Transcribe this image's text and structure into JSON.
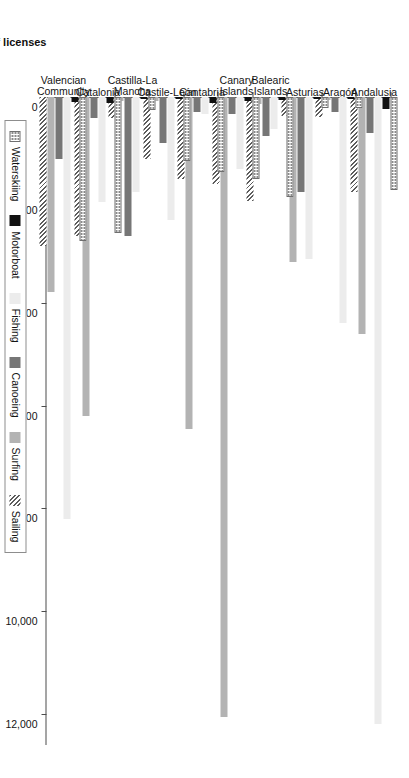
{
  "chart_data": {
    "type": "bar",
    "orientation": "horizontal",
    "title": "",
    "xlabel": "Number of licenses",
    "ylabel": "",
    "xlim": [
      0,
      12600
    ],
    "grid": false,
    "legend_position": "bottom",
    "tick_labels": [
      "0",
      "2,000",
      "4,000",
      "6,000",
      "8,000",
      "10,000",
      "12,000"
    ],
    "tick_values": [
      0,
      2000,
      4000,
      6000,
      8000,
      10000,
      12000
    ],
    "categories": [
      "Andalusia",
      "Aragón",
      "Asturias",
      "Balearic\nIslands",
      "Canary\nIslands",
      "Cantabria",
      "Castile-León",
      "Castilla-La\nMancha",
      "Catalonia",
      "Valencian\nCommunity"
    ],
    "series": [
      {
        "name": "Waterskiing",
        "color": "#ffffff",
        "pattern": "dotted",
        "values": [
          1800,
          220,
          220,
          1950,
          1600,
          1450,
          1250,
          260,
          2650,
          2800
        ]
      },
      {
        "name": "Motorboat",
        "color": "#111111",
        "pattern": "solid",
        "values": [
          230,
          40,
          40,
          60,
          70,
          120,
          40,
          40,
          110,
          90
        ]
      },
      {
        "name": "Fishing",
        "color": "#ececec",
        "pattern": "solid",
        "values": [
          12200,
          4400,
          3150,
          620,
          1400,
          330,
          2400,
          1850,
          2050,
          8200
        ]
      },
      {
        "name": "Canoeing",
        "color": "#767676",
        "pattern": "solid",
        "values": [
          700,
          300,
          1850,
          750,
          330,
          300,
          900,
          2700,
          400,
          1200
        ]
      },
      {
        "name": "Surfing",
        "color": "#b3b3b3",
        "pattern": "solid",
        "values": [
          4600,
          60,
          3200,
          130,
          12050,
          6450,
          80,
          70,
          6200,
          3800
        ]
      },
      {
        "name": "Sailing",
        "color": "#ffffff",
        "pattern": "hatch",
        "values": [
          1850,
          380,
          360,
          2030,
          1700,
          1600,
          1200,
          400,
          2700,
          2900
        ]
      }
    ]
  },
  "axis": {
    "value_axis_title": "Number of licenses"
  },
  "legend": {
    "items": [
      {
        "label": "Waterskiing",
        "swatch": "waterskiing"
      },
      {
        "label": "Motorboat",
        "swatch": "motorboat"
      },
      {
        "label": "Fishing",
        "swatch": "fishing"
      },
      {
        "label": "Canoeing",
        "swatch": "canoeing"
      },
      {
        "label": "Surfing",
        "swatch": "surfing"
      },
      {
        "label": "Sailing",
        "swatch": "sailing"
      }
    ]
  }
}
